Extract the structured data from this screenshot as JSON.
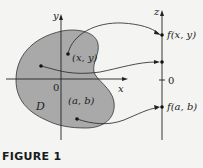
{
  "figure": {
    "caption": "FIGURE 1",
    "region_label": "D",
    "axes": {
      "x_label": "x",
      "y_label": "y",
      "z_label": "z",
      "origin_label": "0",
      "z_zero_label": "0"
    },
    "points": [
      {
        "label": "(x, y)",
        "maps_to": "f(x, y)"
      },
      {
        "label": "",
        "maps_to": ""
      },
      {
        "label": "(a, b)",
        "maps_to": "f(a, b)"
      }
    ],
    "colors": {
      "region_fill": "#a9a9a9",
      "lines": "#222222",
      "background": "#f4f4f2"
    }
  }
}
